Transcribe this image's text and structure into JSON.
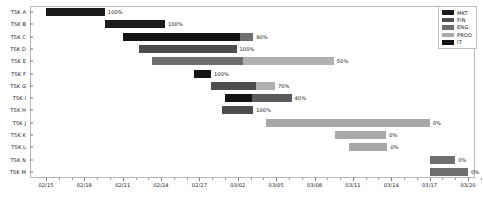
{
  "chart_data": {
    "type": "bar",
    "chart_kind": "gantt",
    "title": "",
    "xlabel": "",
    "ylabel": "",
    "grid": false,
    "legend_position": "top-right",
    "x_axis": {
      "start": "02/15",
      "end": "03/21",
      "tick_labels": [
        "02/15",
        "02/18",
        "02/21",
        "02/24",
        "02/27",
        "03/02",
        "03/05",
        "03/08",
        "03/11",
        "03/14",
        "03/17",
        "03/20"
      ],
      "tick_days": [
        0,
        3,
        6,
        9,
        12,
        15,
        18,
        21,
        24,
        27,
        30,
        33
      ],
      "total_days": 34
    },
    "categories": [
      "TSK A",
      "TSK B",
      "TSK C",
      "TSK D",
      "TSK E",
      "TSK F",
      "TSK G",
      "TSK I",
      "TSK H",
      "TSK J",
      "TSK K",
      "TSK L",
      "TSK N",
      "TSK M"
    ],
    "legend": [
      {
        "label": "MKT",
        "color": "#1a1a1a"
      },
      {
        "label": "FIN",
        "color": "#4d4d4d"
      },
      {
        "label": "ENG",
        "color": "#6e6e6e"
      },
      {
        "label": "PROD",
        "color": "#a8a8a8"
      },
      {
        "label": "IT",
        "color": "#111111"
      }
    ],
    "tasks": [
      {
        "name": "TSK A",
        "dept": "MKT",
        "start_day": 0.0,
        "duration_days": 4.6,
        "progress": "100%",
        "progress_value": 100,
        "done_color": "#1a1a1a",
        "todo_color": "#c4c4c4"
      },
      {
        "name": "TSK B",
        "dept": "MKT",
        "start_day": 4.6,
        "duration_days": 4.7,
        "progress": "100%",
        "progress_value": 100,
        "done_color": "#1a1a1a",
        "todo_color": "#c4c4c4"
      },
      {
        "name": "TSK C",
        "dept": "IT",
        "start_day": 6.0,
        "duration_days": 10.2,
        "progress": "90%",
        "progress_value": 90,
        "done_color": "#141414",
        "todo_color": "#6e6e6e"
      },
      {
        "name": "TSK D",
        "dept": "FIN",
        "start_day": 7.3,
        "duration_days": 7.6,
        "progress": "100%",
        "progress_value": 100,
        "done_color": "#4d4d4d",
        "todo_color": "#c4c4c4"
      },
      {
        "name": "TSK E",
        "dept": "ENG",
        "start_day": 8.3,
        "duration_days": 14.2,
        "progress": "50%",
        "progress_value": 50,
        "done_color": "#6e6e6e",
        "todo_color": "#b0b0b0"
      },
      {
        "name": "TSK F",
        "dept": "IT",
        "start_day": 11.6,
        "duration_days": 1.3,
        "progress": "100%",
        "progress_value": 100,
        "done_color": "#141414",
        "todo_color": "#c4c4c4"
      },
      {
        "name": "TSK G",
        "dept": "FIN",
        "start_day": 12.9,
        "duration_days": 5.0,
        "progress": "70%",
        "progress_value": 70,
        "done_color": "#4d4d4d",
        "todo_color": "#b0b0b0"
      },
      {
        "name": "TSK I",
        "dept": "IT",
        "start_day": 14.0,
        "duration_days": 5.2,
        "progress": "40%",
        "progress_value": 40,
        "done_color": "#141414",
        "todo_color": "#5a5a5a"
      },
      {
        "name": "TSK H",
        "dept": "FIN",
        "start_day": 13.8,
        "duration_days": 2.4,
        "progress": "100%",
        "progress_value": 100,
        "done_color": "#4d4d4d",
        "todo_color": "#c4c4c4"
      },
      {
        "name": "TSK J",
        "dept": "PROD",
        "start_day": 17.2,
        "duration_days": 12.8,
        "progress": "0%",
        "progress_value": 0,
        "done_color": "#a8a8a8",
        "todo_color": "#a8a8a8"
      },
      {
        "name": "TSK K",
        "dept": "PROD",
        "start_day": 22.6,
        "duration_days": 4.0,
        "progress": "0%",
        "progress_value": 0,
        "done_color": "#a8a8a8",
        "todo_color": "#a8a8a8"
      },
      {
        "name": "TSK L",
        "dept": "PROD",
        "start_day": 23.7,
        "duration_days": 3.0,
        "progress": "0%",
        "progress_value": 0,
        "done_color": "#a8a8a8",
        "todo_color": "#a8a8a8"
      },
      {
        "name": "TSK N",
        "dept": "ENG",
        "start_day": 30.0,
        "duration_days": 2.0,
        "progress": "0%",
        "progress_value": 0,
        "done_color": "#6e6e6e",
        "todo_color": "#6e6e6e"
      },
      {
        "name": "TSK M",
        "dept": "ENG",
        "start_day": 30.0,
        "duration_days": 3.0,
        "progress": "0%",
        "progress_value": 0,
        "done_color": "#6e6e6e",
        "todo_color": "#6e6e6e"
      }
    ]
  }
}
